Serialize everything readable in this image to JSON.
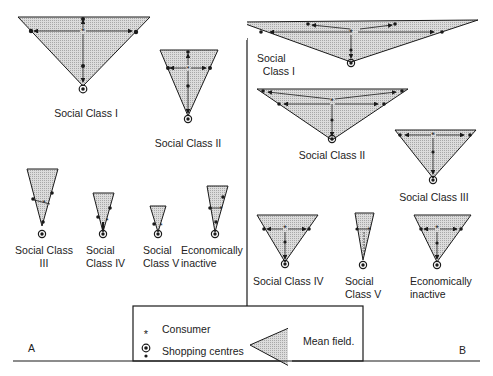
{
  "panels": {
    "A": {
      "label": "A",
      "fields": [
        {
          "id": "sc1",
          "label": "Social Class I"
        },
        {
          "id": "sc2",
          "label": "Social Class II"
        },
        {
          "id": "sc3",
          "label": "Social Class\nIII"
        },
        {
          "id": "sc4",
          "label": "Social\nClass IV"
        },
        {
          "id": "sc5",
          "label": "Social\nClass V"
        },
        {
          "id": "ei",
          "label": "Economically\ninactive"
        }
      ]
    },
    "B": {
      "label": "B",
      "fields": [
        {
          "id": "sc1",
          "label": "Social\n  Class I"
        },
        {
          "id": "sc2",
          "label": "Social Class II"
        },
        {
          "id": "sc3",
          "label": "Social Class III"
        },
        {
          "id": "sc4",
          "label": "Social Class IV"
        },
        {
          "id": "sc5",
          "label": "Social\nClass V"
        },
        {
          "id": "ei",
          "label": "Economically\ninactive"
        }
      ]
    }
  },
  "legend": {
    "consumer_symbol": "*",
    "consumer_label": "Consumer",
    "shopping_label": "Shopping centres",
    "mean_field_label": "Mean field."
  },
  "colors": {
    "ink": "#1a1a1a",
    "field_fill": "#cfcfcf",
    "background": "#ffffff"
  }
}
